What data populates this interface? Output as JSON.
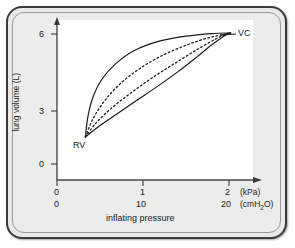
{
  "figure": {
    "kind": "pressure-volume-curve-figure",
    "background_color": "#ececec",
    "frame_color": "#3a3a3a"
  },
  "chart_data": {
    "type": "line",
    "title": "",
    "xlabel": "inflating pressure",
    "ylabel": "lung volume (L)",
    "xlim": [
      0,
      2.2
    ],
    "ylim": [
      0,
      6.6
    ],
    "grid": false,
    "legend": false,
    "axes": {
      "y": {
        "label": "lung volume (L)",
        "unit": "L",
        "ticks": [
          0,
          3,
          6
        ],
        "tick_labels": [
          "0",
          "3",
          "6"
        ],
        "arrow": true
      },
      "x_primary": {
        "unit": "(kPa)",
        "ticks": [
          0,
          1,
          2
        ],
        "tick_labels": [
          "0",
          "1",
          "2"
        ],
        "arrow": true
      },
      "x_secondary": {
        "unit": "(cmH2O)",
        "unit_display": "(cmH₂O)",
        "ticks": [
          0,
          10,
          20
        ],
        "tick_labels": [
          "0",
          "10",
          "20"
        ]
      }
    },
    "annotations": [
      {
        "text": "VC",
        "x": 2.05,
        "y": 6.05,
        "description": "vital capacity upper point",
        "leader_line": true
      },
      {
        "text": "RV",
        "x": 0.33,
        "y": 1.25,
        "description": "residual volume lower point",
        "leader_line": false
      }
    ],
    "series": [
      {
        "name": "outer-deflation-limb",
        "style": "solid",
        "color": "#1b1b1b",
        "points": [
          [
            0.33,
            1.25
          ],
          [
            0.36,
            2.2
          ],
          [
            0.42,
            3.1
          ],
          [
            0.52,
            3.9
          ],
          [
            0.68,
            4.62
          ],
          [
            0.9,
            5.24
          ],
          [
            1.18,
            5.66
          ],
          [
            1.5,
            5.9
          ],
          [
            1.8,
            6.02
          ],
          [
            2.02,
            6.05
          ]
        ]
      },
      {
        "name": "inner-dashed-limb-upper",
        "style": "dashed",
        "color": "#1b1b1b",
        "points": [
          [
            0.33,
            1.25
          ],
          [
            0.42,
            2.1
          ],
          [
            0.56,
            2.95
          ],
          [
            0.74,
            3.72
          ],
          [
            0.96,
            4.4
          ],
          [
            1.22,
            5.0
          ],
          [
            1.5,
            5.48
          ],
          [
            1.76,
            5.82
          ],
          [
            1.94,
            5.98
          ],
          [
            2.02,
            6.05
          ]
        ]
      },
      {
        "name": "inner-dashed-limb-lower",
        "style": "dashed",
        "color": "#1b1b1b",
        "points": [
          [
            0.33,
            1.25
          ],
          [
            0.46,
            1.92
          ],
          [
            0.64,
            2.6
          ],
          [
            0.86,
            3.28
          ],
          [
            1.1,
            3.96
          ],
          [
            1.36,
            4.62
          ],
          [
            1.62,
            5.26
          ],
          [
            1.84,
            5.76
          ],
          [
            1.96,
            5.98
          ],
          [
            2.02,
            6.05
          ]
        ]
      },
      {
        "name": "outer-inflation-limb",
        "style": "solid",
        "color": "#1b1b1b",
        "points": [
          [
            0.33,
            1.25
          ],
          [
            0.5,
            1.78
          ],
          [
            0.7,
            2.32
          ],
          [
            0.92,
            2.92
          ],
          [
            1.16,
            3.56
          ],
          [
            1.4,
            4.24
          ],
          [
            1.62,
            4.92
          ],
          [
            1.8,
            5.5
          ],
          [
            1.94,
            5.9
          ],
          [
            2.02,
            6.05
          ]
        ]
      }
    ]
  },
  "labels": {
    "ylabel": "lung volume (L)",
    "ytick_6": "6",
    "ytick_3": "3",
    "ytick_0": "0",
    "xtick_kpa_0": "0",
    "xtick_kpa_1": "1",
    "xtick_kpa_2": "2",
    "xunit_kpa": "(kPa)",
    "xtick_cm_0": "0",
    "xtick_cm_10": "10",
    "xtick_cm_20": "20",
    "xunit_cm_pre": "(cmH",
    "xunit_cm_sub": "2",
    "xunit_cm_post": "O)",
    "xlabel": "inflating pressure",
    "annotation_vc": "VC",
    "annotation_rv": "RV"
  }
}
